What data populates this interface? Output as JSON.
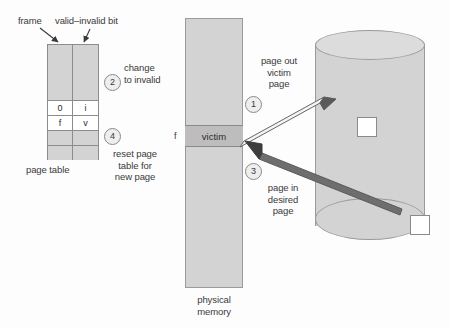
{
  "diagram": {
    "colors": {
      "background": "#fdfdfd",
      "block_gray": "#d3d3d3",
      "victim_gray": "#bdbdbd",
      "border_gray": "#8c8c8c",
      "arrow_dark": "#555555",
      "arrow_light": "#f2f2f2",
      "text": "#3a3a3a"
    }
  },
  "page_table": {
    "caption": "page table",
    "column_labels": {
      "frame": "frame",
      "valid_invalid": "valid–invalid bit"
    },
    "columns": [
      "frame",
      "valid-invalid bit"
    ],
    "rows": [
      {
        "frame": "",
        "valid": "",
        "shade": "gray",
        "tall": true
      },
      {
        "frame": "0",
        "valid": "i",
        "shade": "white",
        "tall": false
      },
      {
        "frame": "f",
        "valid": "v",
        "shade": "white",
        "tall": false
      },
      {
        "frame": "",
        "valid": "",
        "shade": "gray",
        "tall": false
      },
      {
        "frame": "",
        "valid": "",
        "shade": "gray",
        "tall": false
      }
    ]
  },
  "physical_memory": {
    "caption": "physical\nmemory",
    "victim_frame_label": "victim",
    "frame_index_label": "f"
  },
  "disk": {
    "blocks": [
      "",
      ""
    ]
  },
  "steps": [
    {
      "number": "1",
      "text": "page out\nvictim\npage"
    },
    {
      "number": "2",
      "text": "change\nto invalid"
    },
    {
      "number": "3",
      "text": "page in\ndesired\npage"
    },
    {
      "number": "4",
      "text": "reset page\ntable for\nnew page"
    }
  ]
}
